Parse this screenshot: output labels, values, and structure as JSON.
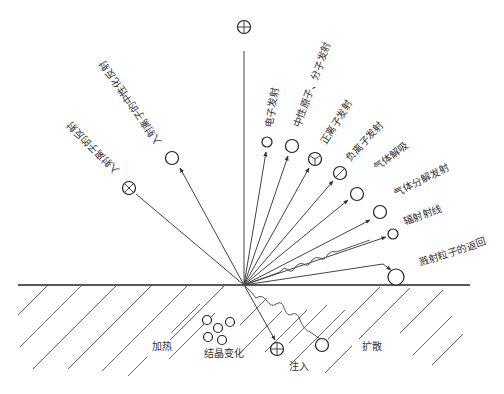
{
  "diagram": {
    "title": "",
    "incident_labels": {
      "neutralized_reflection": "入射离子的中性化反射",
      "ion_reflection": "入射离子的反射"
    },
    "emission_labels": {
      "electron": "电子发射",
      "neutral": "中性原子、分子发射",
      "positive_ion": "正离子发射",
      "negative_ion": "负离子发射",
      "gas_desorption": "气体解吸",
      "gas_decomposition": "气体分解发射",
      "radiation": "辐射射线",
      "sputter_return": "溅射粒子的返回"
    },
    "substrate_labels": {
      "heating": "加热",
      "crystal_change": "结晶变化",
      "implantation": "注入",
      "diffusion": "扩散"
    },
    "symbols": {
      "incident_ion": "circle-plus",
      "reflected_ion": "circle-cross",
      "positive_ion": "circle-y",
      "negative_ion": "circle-slash",
      "implanted": "circle-plus"
    },
    "colors": {
      "line": "#444444",
      "text": "#333333",
      "background": "#ffffff"
    }
  }
}
